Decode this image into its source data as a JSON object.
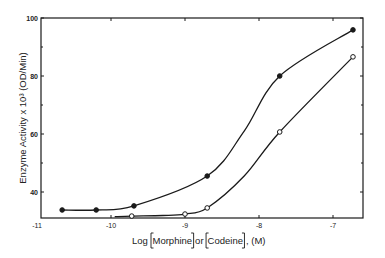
{
  "chart_data": {
    "type": "line",
    "title": "",
    "xlabel": "Log [Morphine] or [Codeine], (M)",
    "xlabel_parts": [
      "Log ",
      "Morphine",
      "or",
      "Codeine",
      ", (M)"
    ],
    "ylabel": "Enzyme Activity x 10³ (OD/Min)",
    "xlim": [
      -11,
      -6.6
    ],
    "ylim": [
      31,
      100
    ],
    "x_ticks": [
      -11,
      -10,
      -9,
      -8,
      -7
    ],
    "x_tick_labels": [
      "-11",
      "-10",
      "-9",
      "-8",
      "-7"
    ],
    "y_ticks": [
      40,
      60,
      80,
      100
    ],
    "y_tick_labels": [
      "40",
      "60",
      "80",
      "100"
    ],
    "y_minor_ticks": [
      50,
      70,
      90
    ],
    "grid": false,
    "legend": null,
    "series": [
      {
        "name": "filled circles",
        "marker": "filled-circle",
        "x": [
          -10.66,
          -10.2,
          -9.69,
          -8.7,
          -7.72,
          -6.73
        ],
        "y": [
          33.8,
          33.8,
          35.2,
          45.5,
          80.0,
          95.9
        ]
      },
      {
        "name": "open circles",
        "marker": "open-circle",
        "x": [
          -9.72,
          -9.0,
          -8.7,
          -7.72,
          -6.73
        ],
        "y": [
          31.7,
          32.4,
          34.5,
          60.7,
          86.6
        ]
      }
    ]
  },
  "colors": {
    "ink": "#1a1a1a",
    "background": "#ffffff"
  }
}
